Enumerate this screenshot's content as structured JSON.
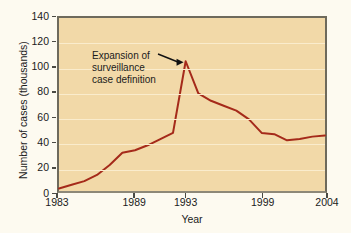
{
  "chart_data": {
    "type": "line",
    "title": "",
    "xlabel": "Year",
    "ylabel": "Number of cases (thousands)",
    "xlim": [
      1983,
      2004
    ],
    "ylim": [
      0,
      140
    ],
    "grid": true,
    "legend": "none",
    "line_color": "#A52A1A",
    "plot_background": "#F2D9A8",
    "figure_background": "#FDFAF0",
    "xticks": [
      1983,
      1989,
      1993,
      1999,
      2004
    ],
    "xtick_labels": [
      "1983",
      "1989",
      "1993",
      "1999",
      "2004"
    ],
    "yticks": [
      0,
      20,
      40,
      60,
      80,
      100,
      120,
      140
    ],
    "ytick_labels": [
      "0",
      "20",
      "40",
      "60",
      "80",
      "100",
      "120",
      "140"
    ],
    "x": [
      1983,
      1984,
      1985,
      1986,
      1987,
      1988,
      1989,
      1990,
      1991,
      1992,
      1993,
      1994,
      1995,
      1996,
      1997,
      1998,
      1999,
      2000,
      2001,
      2002,
      2003,
      2004
    ],
    "values": [
      2,
      5,
      8,
      13,
      21,
      31,
      33,
      37,
      42,
      47,
      105,
      79,
      73,
      69,
      65,
      58,
      47,
      46,
      41,
      42,
      44,
      45
    ],
    "series": [
      {
        "name": "Number of cases (thousands)",
        "values": [
          2,
          5,
          8,
          13,
          21,
          31,
          33,
          37,
          42,
          47,
          105,
          79,
          73,
          69,
          65,
          58,
          47,
          46,
          41,
          42,
          44,
          45
        ]
      }
    ],
    "annotations": [
      {
        "lines": [
          "Expansion of",
          "surveillance",
          "case definition"
        ],
        "points_to_x": 1993,
        "points_to_y": 105,
        "arrow": true
      }
    ]
  }
}
